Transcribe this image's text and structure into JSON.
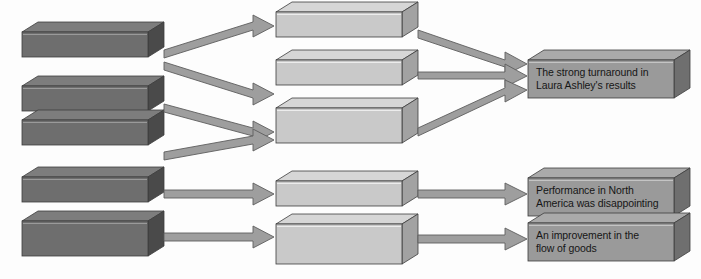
{
  "diagram": {
    "type": "flow-diagram",
    "title": "",
    "background_color": "#fdfdfd",
    "orientation": "left-to-right",
    "columns": 3,
    "palette": {
      "left_box_face": "#6e6e6e",
      "left_box_top": "#7d7d7d",
      "left_box_side": "#4a4a4a",
      "middle_box_face": "#c9c9c9",
      "middle_box_top": "#d6d6d6",
      "middle_box_side": "#a2a2a2",
      "right_box_face": "#9a9a9a",
      "right_box_top": "#aaaaaa",
      "right_box_side": "#6f6f6f",
      "arrow_fill": "#9e9e9e",
      "arrow_stroke": "#5d5d5d",
      "box_stroke": "#3c3c3c",
      "text_color": "#161616"
    },
    "left_column": {
      "name": "inputs",
      "count": 5,
      "boxes": [
        {
          "id": "left-1",
          "label": "",
          "x": 22,
          "y": 32,
          "w": 126,
          "h": 25
        },
        {
          "id": "left-2",
          "label": "",
          "x": 22,
          "y": 86,
          "w": 126,
          "h": 25
        },
        {
          "id": "left-3",
          "label": "",
          "x": 22,
          "y": 120,
          "w": 126,
          "h": 25
        },
        {
          "id": "left-4",
          "label": "",
          "x": 22,
          "y": 177,
          "w": 126,
          "h": 25
        },
        {
          "id": "left-5",
          "label": "",
          "x": 22,
          "y": 221,
          "w": 126,
          "h": 25
        }
      ]
    },
    "middle_column": {
      "name": "processes",
      "count": 5,
      "boxes": [
        {
          "id": "mid-1",
          "label": "",
          "x": 276,
          "y": 12,
          "w": 126,
          "h": 25
        },
        {
          "id": "mid-2",
          "label": "",
          "x": 276,
          "y": 60,
          "w": 126,
          "h": 25
        },
        {
          "id": "mid-3",
          "label": "",
          "x": 276,
          "y": 108,
          "w": 126,
          "h": 25
        },
        {
          "id": "mid-4",
          "label": "",
          "x": 276,
          "y": 181,
          "w": 126,
          "h": 25
        },
        {
          "id": "mid-5",
          "label": "",
          "x": 276,
          "y": 224,
          "w": 126,
          "h": 25
        }
      ]
    },
    "right_column": {
      "name": "outcomes",
      "count": 3,
      "boxes": [
        {
          "id": "right-1",
          "label": "The strong turnaround in\nLaura Ashley's results",
          "x": 528,
          "y": 60,
          "w": 162,
          "h": 38
        },
        {
          "id": "right-2",
          "label": "Performance in North\nAmerica was disappointing",
          "x": 528,
          "y": 178,
          "w": 162,
          "h": 38
        },
        {
          "id": "right-3",
          "label": "An improvement in the\nflow of goods",
          "x": 528,
          "y": 223,
          "w": 162,
          "h": 38
        }
      ]
    },
    "arrows": {
      "stage_one_count": 4,
      "stage_two_count": 5,
      "total": 9
    }
  }
}
